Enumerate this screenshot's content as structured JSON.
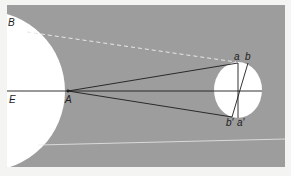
{
  "diagram": {
    "colors": {
      "page_background": "#f4f4f2",
      "field_gray": "#9d9d9d",
      "body_white": "#ffffff",
      "line_dark": "#1c1c1c",
      "dashed_line": "#e6e6e6"
    },
    "labels": {
      "B": "B",
      "E": "E",
      "A": "A",
      "a_top": "a",
      "b_top": "b",
      "b_prime": "b′",
      "a_prime": "a′"
    },
    "shapes": {
      "large_body": {
        "cx": -15,
        "cy": 91,
        "r": 80
      },
      "small_body": {
        "cx": 238,
        "cy": 90,
        "rx": 24,
        "ry": 28
      }
    },
    "points": {
      "B": [
        25,
        30
      ],
      "E": [
        7,
        91
      ],
      "A": [
        68,
        91
      ],
      "a": [
        238,
        63
      ],
      "b": [
        248,
        63
      ],
      "b_prime": [
        232,
        117
      ],
      "a_prime": [
        238,
        118
      ]
    }
  }
}
